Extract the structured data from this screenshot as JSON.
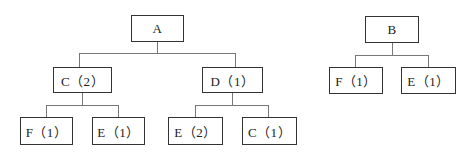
{
  "diagram": {
    "type": "tree",
    "trees": [
      {
        "root": {
          "id": "A",
          "label": "A"
        },
        "children": [
          {
            "id": "C",
            "label": "C（2）",
            "children": [
              {
                "id": "F1",
                "label": "F（1）"
              },
              {
                "id": "E1",
                "label": "E（1）"
              }
            ]
          },
          {
            "id": "D",
            "label": "D（1）",
            "children": [
              {
                "id": "E2",
                "label": "E（2）"
              },
              {
                "id": "C1",
                "label": "C（1）"
              }
            ]
          }
        ]
      },
      {
        "root": {
          "id": "B",
          "label": "B"
        },
        "children": [
          {
            "id": "BF",
            "label": "F（1）"
          },
          {
            "id": "BE",
            "label": "E（1）"
          }
        ]
      }
    ]
  },
  "nodes": {
    "A": "A",
    "C2": "C（2）",
    "D1": "D（1）",
    "F1_a": "F（1）",
    "E1_a": "E（1）",
    "E2_a": "E（2）",
    "C1_a": "C（1）",
    "B": "B",
    "F1_b": "F（1）",
    "E1_b": "E（1）"
  },
  "colors": {
    "border": "#333333",
    "connector": "#777777",
    "background": "#ffffff"
  }
}
